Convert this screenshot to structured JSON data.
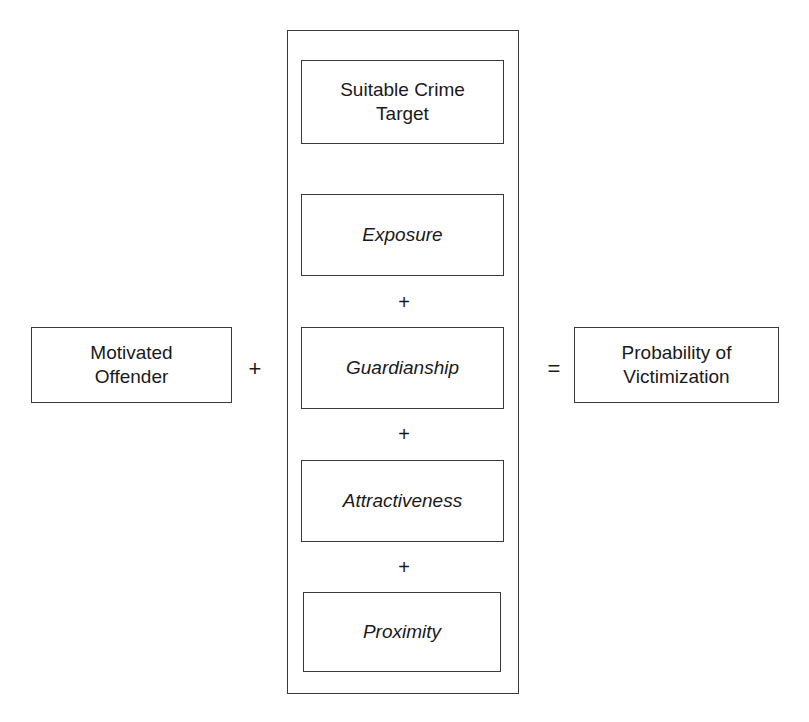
{
  "diagram": {
    "left_operand": {
      "name": "motivated-offender",
      "label": "Motivated\nOffender",
      "style": "normal"
    },
    "operators": {
      "outer_plus": "+",
      "equals": "=",
      "inner_plus_1": "+",
      "inner_plus_2": "+",
      "inner_plus_3": "+"
    },
    "container": {
      "name": "suitable-crime-target-group",
      "heading_box": {
        "name": "suitable-crime-target",
        "label": "Suitable Crime\nTarget",
        "style": "normal"
      },
      "components": [
        {
          "name": "exposure",
          "label": "Exposure",
          "style": "italic"
        },
        {
          "name": "guardianship",
          "label": "Guardianship",
          "style": "italic"
        },
        {
          "name": "attractiveness",
          "label": "Attractiveness",
          "style": "italic"
        },
        {
          "name": "proximity",
          "label": "Proximity",
          "style": "italic"
        }
      ]
    },
    "right_operand": {
      "name": "probability-of-victimization",
      "label": "Probability of\nVictimization",
      "style": "normal"
    },
    "colors": {
      "border": "#3a3a3a",
      "text": "#1a1a1a",
      "background": "#ffffff"
    }
  }
}
